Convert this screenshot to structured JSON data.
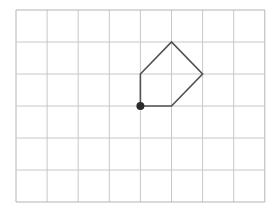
{
  "diagram": {
    "type": "grid-polygon",
    "grid": {
      "columns": 8,
      "rows": 6,
      "origin_px": [
        16,
        10
      ],
      "cell_w": 31.1,
      "cell_h": 32,
      "line_color": "#c8c8c8",
      "border_color": "#b4b4b4"
    },
    "shape": {
      "stroke_color": "#505050",
      "stroke_width": 1.6,
      "vertices": [
        [
          4,
          3
        ],
        [
          4,
          2
        ],
        [
          5,
          1
        ],
        [
          6,
          2
        ],
        [
          5,
          3
        ]
      ],
      "closed": true
    },
    "start_point": {
      "position": [
        4,
        3
      ],
      "color": "#2a2a2a",
      "radius": 4
    }
  }
}
